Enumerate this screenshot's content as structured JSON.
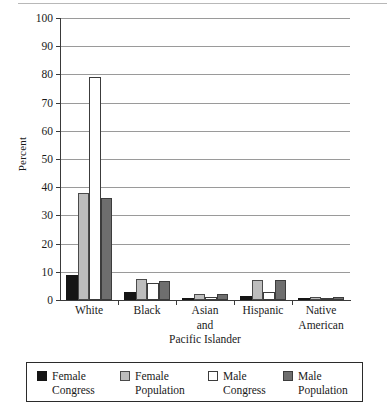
{
  "chart_data": {
    "type": "bar",
    "title": "",
    "xlabel": "",
    "ylabel": "Percent",
    "ylim": [
      0,
      100
    ],
    "yticks": [
      0,
      10,
      20,
      30,
      40,
      50,
      60,
      70,
      80,
      90,
      100
    ],
    "ytick_labels": [
      "0",
      "10",
      "20",
      "30",
      "40",
      "50",
      "60",
      "70",
      "80",
      "90",
      "100"
    ],
    "grid": true,
    "legend_position": "bottom",
    "categories": [
      "White",
      "Black",
      "Asian and Pacific Islander",
      "Hispanic",
      "Native American"
    ],
    "category_lines": [
      {
        "l1": "White",
        "l2": "",
        "l3": ""
      },
      {
        "l1": "Black",
        "l2": "",
        "l3": ""
      },
      {
        "l1": "Asian",
        "l2": "and",
        "l3": "Pacific Islander"
      },
      {
        "l1": "Hispanic",
        "l2": "",
        "l3": ""
      },
      {
        "l1": "Native",
        "l2": "American",
        "l3": ""
      }
    ],
    "series": [
      {
        "name": "Female Congress",
        "name_l1": "Female",
        "name_l2": "Congress",
        "key": "fc",
        "color": "#151515",
        "values": [
          8.8,
          3.0,
          0.7,
          1.5,
          0.6
        ]
      },
      {
        "name": "Female Population",
        "name_l1": "Female",
        "name_l2": "Population",
        "key": "fp",
        "color": "#bdbdbd",
        "values": [
          38.0,
          7.4,
          2.0,
          7.0,
          0.9
        ]
      },
      {
        "name": "Male Congress",
        "name_l1": "Male",
        "name_l2": "Congress",
        "key": "mc",
        "color": "#ffffff",
        "values": [
          79.0,
          6.0,
          1.0,
          3.0,
          0.5
        ]
      },
      {
        "name": "Male Population",
        "name_l1": "Male",
        "name_l2": "Population",
        "key": "mp",
        "color": "#6e6e6e",
        "values": [
          36.0,
          6.8,
          2.2,
          7.0,
          1.0
        ]
      }
    ]
  }
}
